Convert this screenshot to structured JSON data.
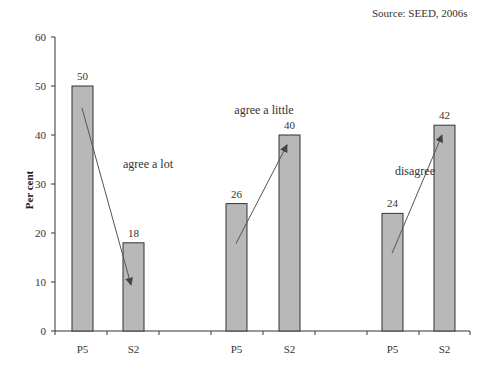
{
  "chart_data": {
    "type": "bar",
    "title": "",
    "source": "Source: SEED, 2006s",
    "xlabel": "",
    "ylabel": "Per cent",
    "ylim": [
      0,
      60
    ],
    "yticks": [
      0,
      10,
      20,
      30,
      40,
      50,
      60
    ],
    "grid": false,
    "legend": null,
    "groups": [
      {
        "label": "agree a lot",
        "categories": [
          "P5",
          "S2"
        ],
        "values": [
          50,
          18
        ],
        "arrow": "down"
      },
      {
        "label": "agree a little",
        "categories": [
          "P5",
          "S2"
        ],
        "values": [
          26,
          40
        ],
        "arrow": "up"
      },
      {
        "label": "disagree",
        "categories": [
          "P5",
          "S2"
        ],
        "values": [
          24,
          42
        ],
        "arrow": "up"
      }
    ],
    "categories": [
      "P5",
      "S2",
      "P5",
      "S2",
      "P5",
      "S2"
    ],
    "values": [
      50,
      18,
      26,
      40,
      24,
      42
    ],
    "bar_color": "#b8b8b8",
    "bar_edge_color": "#333333"
  }
}
